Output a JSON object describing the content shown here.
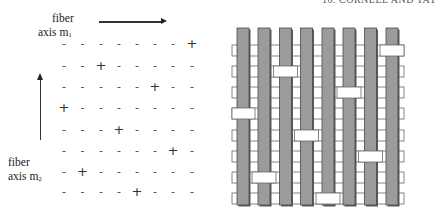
{
  "header": {
    "text": "10. CORNELL AND TAY"
  },
  "labels": {
    "axis1": {
      "line1": "fiber",
      "line2": "axis m",
      "sub": "1"
    },
    "axis2": {
      "line1": "fiber",
      "line2": "axis m",
      "sub": "2"
    }
  },
  "sign_matrix": {
    "rows": 8,
    "cols": 8,
    "plus_symbol": "+",
    "minus_symbol": "-",
    "plus_col_per_row": [
      8,
      3,
      6,
      1,
      4,
      7,
      2,
      5
    ]
  },
  "weave": {
    "warp_count": 8,
    "weft_count": 8,
    "warp_color": "#9b9b9b",
    "warp_edge_color": "#4a4a4a",
    "weft_color": "#ffffff",
    "weft_edge_color": "#666666",
    "float_bar_per_row": [
      8,
      3,
      6,
      1,
      4,
      7,
      2,
      5
    ]
  }
}
